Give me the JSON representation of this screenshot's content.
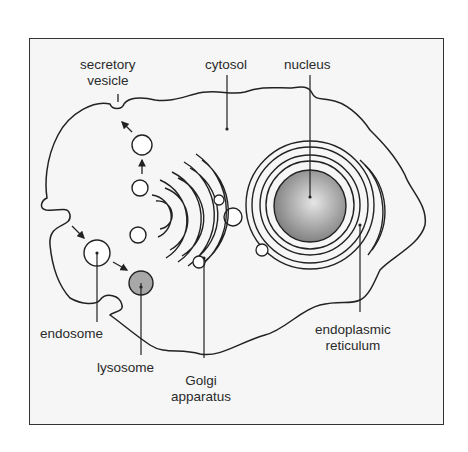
{
  "diagram": {
    "labels": {
      "secretory_vesicle": [
        "secretory",
        "vesicle"
      ],
      "cytosol": "cytosol",
      "nucleus": "nucleus",
      "endosome": "endosome",
      "lysosome": "lysosome",
      "golgi": [
        "Golgi",
        "apparatus"
      ],
      "er": [
        "endoplasmic",
        "reticulum"
      ]
    },
    "colors": {
      "outline": "#222222",
      "background": "#f6f6f6",
      "nucleus_fill": "#8f8f8f",
      "lysosome_fill": "#a8a8a8"
    }
  }
}
